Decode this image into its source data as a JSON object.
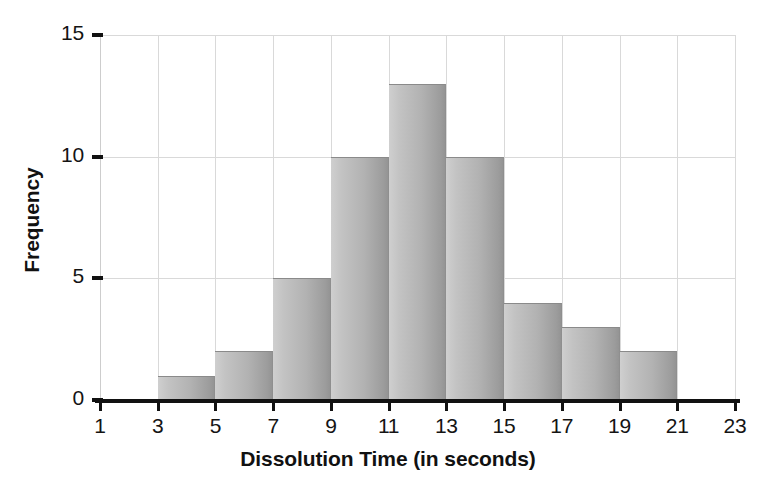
{
  "chart_data": {
    "type": "bar",
    "subtype": "histogram",
    "title": "",
    "xlabel": "Dissolution Time (in seconds)",
    "ylabel": "Frequency",
    "xlim": [
      1,
      23
    ],
    "ylim": [
      0,
      15
    ],
    "xticks": [
      1,
      3,
      5,
      7,
      9,
      11,
      13,
      15,
      17,
      19,
      21,
      23
    ],
    "xtick_labels": [
      "1",
      "3",
      "5",
      "7",
      "9",
      "11",
      "13",
      "15",
      "17",
      "19",
      "21",
      "23"
    ],
    "yticks": [
      0,
      5,
      10,
      15
    ],
    "ytick_labels": [
      "0",
      "5",
      "10",
      "15"
    ],
    "bin_width": 2,
    "grid": true,
    "grid_color": "#d9d9d9",
    "legend": false,
    "bar_fill_light": "#cfcfcf",
    "bar_fill_dark": "#949494",
    "bar_edge_color": "#8a8a8a",
    "axis_color": "#111111",
    "bins": [
      {
        "start": 3,
        "end": 5,
        "frequency": 1
      },
      {
        "start": 5,
        "end": 7,
        "frequency": 2
      },
      {
        "start": 7,
        "end": 9,
        "frequency": 5
      },
      {
        "start": 9,
        "end": 11,
        "frequency": 10
      },
      {
        "start": 11,
        "end": 13,
        "frequency": 13
      },
      {
        "start": 13,
        "end": 15,
        "frequency": 10
      },
      {
        "start": 15,
        "end": 17,
        "frequency": 4
      },
      {
        "start": 17,
        "end": 19,
        "frequency": 3
      },
      {
        "start": 19,
        "end": 21,
        "frequency": 2
      }
    ],
    "categories": [
      "3-5",
      "5-7",
      "7-9",
      "9-11",
      "11-13",
      "13-15",
      "15-17",
      "17-19",
      "19-21"
    ],
    "values": [
      1,
      2,
      5,
      10,
      13,
      10,
      4,
      3,
      2
    ],
    "total_count": 50
  }
}
